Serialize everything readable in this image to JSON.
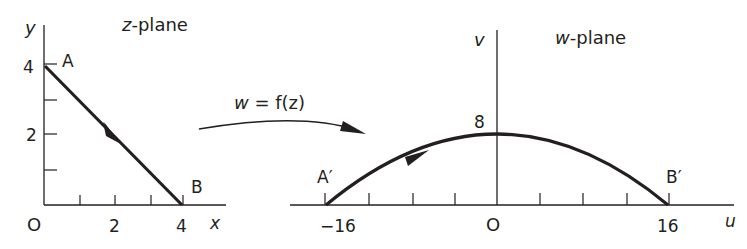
{
  "diagram": {
    "type": "conformal-mapping",
    "colors": {
      "ink": "#231f20",
      "background": "#ffffff"
    },
    "z_plane": {
      "title_var": "z",
      "title_rest": "-plane",
      "x_axis_label": "x",
      "y_axis_label": "y",
      "origin_label": "O",
      "x_ticks": [
        {
          "value": 1,
          "label": ""
        },
        {
          "value": 2,
          "label": "2"
        },
        {
          "value": 3,
          "label": ""
        },
        {
          "value": 4,
          "label": "4"
        }
      ],
      "y_ticks": [
        {
          "value": 1,
          "label": ""
        },
        {
          "value": 2,
          "label": "2"
        },
        {
          "value": 3,
          "label": ""
        },
        {
          "value": 4,
          "label": "4"
        }
      ],
      "x_tick_label_2": "2",
      "x_tick_label_4": "4",
      "y_tick_label_2": "2",
      "y_tick_label_4": "4",
      "path": {
        "from": {
          "label": "A",
          "x": 0,
          "y": 4
        },
        "to": {
          "label": "B",
          "x": 4,
          "y": 0
        },
        "shape": "straight line segment",
        "direction": "A to B"
      },
      "point_a_label": "A",
      "point_b_label": "B"
    },
    "mapping": {
      "label": "w = f(z)",
      "label_w": "w",
      "label_rest": " = f(z)",
      "arrow": "curved arrow from z-plane to w-plane"
    },
    "w_plane": {
      "title_var": "w",
      "title_rest": "-plane",
      "u_axis_label": "u",
      "v_axis_label": "v",
      "origin_label": "O",
      "u_ticks_count_each_side": 4,
      "u_tick_label_neg": "−16",
      "u_tick_label_pos": "16",
      "v_label_peak": "8",
      "path": {
        "from": {
          "label": "A′",
          "u": -16,
          "v": 0
        },
        "to": {
          "label": "B′",
          "u": 16,
          "v": 0
        },
        "peak": {
          "u": 0,
          "v": 8
        },
        "shape": "parabolic arc",
        "direction": "A′ to B′"
      },
      "point_a_label": "A′",
      "point_b_label": "B′"
    }
  }
}
